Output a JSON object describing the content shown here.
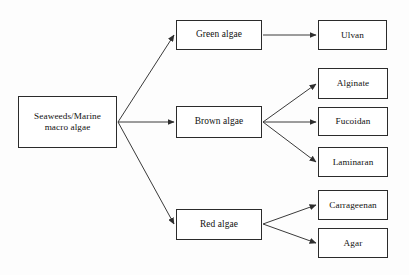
{
  "diagram": {
    "type": "tree-flowchart",
    "background_color": "#fdfdfd",
    "box_border_color": "#2b2b2b",
    "box_fill_color": "#ffffff",
    "connector_color": "#3a3a3a",
    "text_color": "#111111"
  },
  "nodes": {
    "root": {
      "id": "root",
      "label": "Seaweeds/Marine macro algae",
      "line1": "Seaweeds/Marine",
      "line2": "macro algae",
      "level": 0,
      "x": 18,
      "y": 96,
      "w": 99,
      "h": 52
    },
    "green_algae": {
      "id": "green-algae",
      "label": "Green algae",
      "level": 1,
      "x": 176,
      "y": 20,
      "w": 86,
      "h": 30
    },
    "brown_algae": {
      "id": "brown-algae",
      "label": "Brown algae",
      "level": 1,
      "x": 176,
      "y": 106,
      "w": 86,
      "h": 32
    },
    "red_algae": {
      "id": "red-algae",
      "label": "Red algae",
      "level": 1,
      "x": 176,
      "y": 209,
      "w": 86,
      "h": 31
    },
    "ulvan": {
      "id": "ulvan",
      "label": "Ulvan",
      "level": 2,
      "x": 318,
      "y": 20,
      "w": 69,
      "h": 30
    },
    "alginate": {
      "id": "alginate",
      "label": "Alginate",
      "level": 2,
      "x": 318,
      "y": 68,
      "w": 70,
      "h": 31
    },
    "fucoidan": {
      "id": "fucoidan",
      "label": "Fucoidan",
      "level": 2,
      "x": 318,
      "y": 107,
      "w": 70,
      "h": 29
    },
    "laminaran": {
      "id": "laminaran",
      "label": "Laminaran",
      "level": 2,
      "x": 318,
      "y": 147,
      "w": 70,
      "h": 30
    },
    "carrageenan": {
      "id": "carrageenan",
      "label": "Carrageenan",
      "level": 2,
      "x": 318,
      "y": 190,
      "w": 70,
      "h": 30
    },
    "agar": {
      "id": "agar",
      "label": "Agar",
      "level": 2,
      "x": 318,
      "y": 228,
      "w": 70,
      "h": 30
    }
  },
  "edges": [
    {
      "from": "root",
      "to": "green_algae",
      "x1": 118,
      "y1": 122,
      "x2": 174,
      "y2": 35
    },
    {
      "from": "root",
      "to": "brown_algae",
      "x1": 118,
      "y1": 122,
      "x2": 174,
      "y2": 122
    },
    {
      "from": "root",
      "to": "red_algae",
      "x1": 118,
      "y1": 122,
      "x2": 174,
      "y2": 224
    },
    {
      "from": "green_algae",
      "to": "ulvan",
      "x1": 263,
      "y1": 35,
      "x2": 316,
      "y2": 35
    },
    {
      "from": "brown_algae",
      "to": "alginate",
      "x1": 263,
      "y1": 122,
      "x2": 316,
      "y2": 84
    },
    {
      "from": "brown_algae",
      "to": "fucoidan",
      "x1": 263,
      "y1": 122,
      "x2": 316,
      "y2": 122
    },
    {
      "from": "brown_algae",
      "to": "laminaran",
      "x1": 263,
      "y1": 122,
      "x2": 316,
      "y2": 162
    },
    {
      "from": "red_algae",
      "to": "carrageenan",
      "x1": 263,
      "y1": 224,
      "x2": 316,
      "y2": 205
    },
    {
      "from": "red_algae",
      "to": "agar",
      "x1": 263,
      "y1": 224,
      "x2": 316,
      "y2": 243
    }
  ]
}
